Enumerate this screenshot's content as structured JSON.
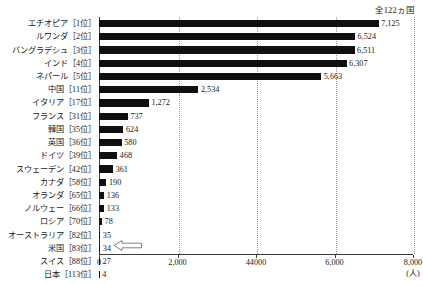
{
  "annotation": {
    "total_countries": "全122ヵ国"
  },
  "chart_data": {
    "type": "bar",
    "orientation": "horizontal",
    "title": "",
    "subtitle": "",
    "xlabel": "(人)",
    "ylabel": "",
    "xlim": [
      0,
      8000
    ],
    "grid": true,
    "legend": null,
    "tick_labels": [
      "0",
      "2,000",
      "44000",
      "6,000",
      "8,000"
    ],
    "tick_values": [
      0,
      2000,
      4000,
      6000,
      8000
    ],
    "categories": [
      "エチオピア［1位］",
      "ルワンダ［2位］",
      "バングラデシュ［3位］",
      "インド［4位］",
      "ネパール［5位］",
      "中国［11位］",
      "イタリア［17位］",
      "フランス［31位］",
      "韓国［35位］",
      "英国［36位］",
      "ドイツ［39位］",
      "スウェーデン［42位］",
      "カナダ［58位］",
      "オランダ［65位］",
      "ノルウェー［66位］",
      "ロシア［70位］",
      "オーストラリア［82位］",
      "米国［83位］",
      "スイス［88位］",
      "日本［113位］"
    ],
    "values": [
      7125,
      6524,
      6511,
      6307,
      5663,
      2534,
      1272,
      737,
      624,
      580,
      468,
      361,
      190,
      136,
      133,
      78,
      35,
      34,
      27,
      4
    ],
    "value_labels": [
      "7,125",
      "6,524",
      "6,511",
      "6,307",
      "5,663",
      "2,534",
      "1,272",
      "737",
      "624",
      "580",
      "468",
      "361",
      "190",
      "136",
      "133",
      "78",
      "35",
      "34",
      "27",
      "4"
    ],
    "bar_color": "#101010",
    "callout": {
      "icon": "left-arrow-icon",
      "target_category": "日本［113位］"
    }
  }
}
